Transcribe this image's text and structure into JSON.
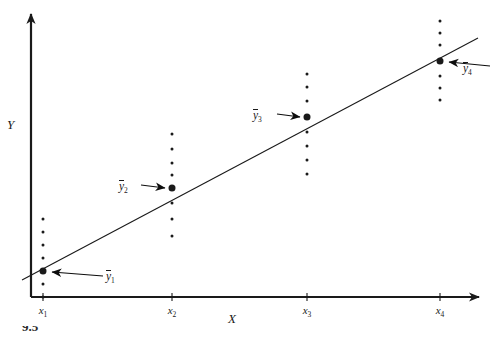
{
  "figure": {
    "width": 491,
    "height": 338,
    "background": "#ffffff",
    "ink_color": "#1a1a1a",
    "axis_labels": {
      "y": "Y",
      "x": "X"
    },
    "caption_partial": "9.5"
  },
  "chart_data": {
    "type": "scatter",
    "title": "",
    "subtitle": "",
    "xlabel": "X",
    "ylabel": "Y",
    "grid": false,
    "legend": null,
    "axis_style": "arrow-headed cartesian axes, no numeric scale",
    "categories": [
      "x1",
      "x2",
      "x3",
      "x4"
    ],
    "tick_labels": [
      "x₁",
      "x₂",
      "x₃",
      "x₄"
    ],
    "tick_x_px": [
      43,
      172,
      307,
      440
    ],
    "regression_line": {
      "label": "",
      "x_start_px": 22,
      "y_start_px": 280,
      "x_end_px": 478,
      "y_end_px": 38,
      "note": "straight fitted line passing through each conditional mean"
    },
    "groups": [
      {
        "name": "x1",
        "tick_label": "x₁",
        "x_px": 43,
        "mean_label": "ȳ₁",
        "mean_label_text": "y₁",
        "mean_y_px": 271,
        "point_y_px": [
          219,
          232,
          245,
          258,
          284,
          297
        ],
        "annotation_arrow": {
          "direction": "right-to-left",
          "tail_x_px": 103,
          "tail_y_px": 276,
          "head_x_px": 52,
          "head_y_px": 272
        },
        "label_x_px": 106,
        "label_y_px": 270
      },
      {
        "name": "x2",
        "tick_label": "x₂",
        "x_px": 172,
        "mean_label": "ȳ₂",
        "mean_label_text": "y₂",
        "mean_y_px": 188,
        "point_y_px": [
          134,
          149,
          163,
          175,
          203,
          219,
          236
        ],
        "annotation_arrow": {
          "direction": "left-to-right",
          "tail_x_px": 141,
          "tail_y_px": 185,
          "head_x_px": 165,
          "head_y_px": 188
        },
        "label_x_px": 119,
        "label_y_px": 180
      },
      {
        "name": "x3",
        "tick_label": "x₃",
        "x_px": 307,
        "mean_label": "ȳ₃",
        "mean_label_text": "y₃",
        "mean_y_px": 117,
        "point_y_px": [
          74,
          87,
          101,
          132,
          146,
          160,
          174
        ],
        "annotation_arrow": {
          "direction": "left-to-right",
          "tail_x_px": 277,
          "tail_y_px": 114,
          "head_x_px": 300,
          "head_y_px": 117
        },
        "label_x_px": 253,
        "label_y_px": 109
      },
      {
        "name": "x4",
        "tick_label": "x₄",
        "x_px": 440,
        "mean_label": "ȳ₄",
        "mean_label_text": "y₄",
        "mean_y_px": 61,
        "point_y_px": [
          21,
          33,
          45,
          76,
          88,
          100
        ],
        "annotation_arrow": {
          "direction": "right-to-left",
          "tail_x_px": 490,
          "tail_y_px": 66,
          "head_x_px": 449,
          "head_y_px": 62
        },
        "label_x_px": 463,
        "label_y_px": 62
      }
    ],
    "annotations": [
      "ȳ₁",
      "ȳ₂",
      "ȳ₃",
      "ȳ₄"
    ]
  }
}
